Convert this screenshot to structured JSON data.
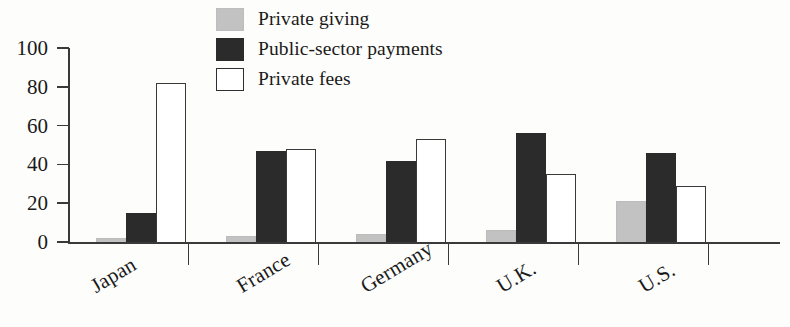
{
  "chart_data": {
    "type": "bar",
    "title": "",
    "subtitle": "",
    "xlabel": "",
    "ylabel": "",
    "ylim": [
      0,
      100
    ],
    "yticks": [
      0,
      20,
      40,
      60,
      80,
      100
    ],
    "ytick_labels": [
      "0",
      "20",
      "40",
      "60",
      "80",
      "100"
    ],
    "grid": false,
    "legend_position": "top-center",
    "categories": [
      "Japan",
      "France",
      "Germany",
      "U.K.",
      "U.S."
    ],
    "series": [
      {
        "name": "Private giving",
        "color": "#c2c2c2",
        "values": [
          2,
          3,
          4,
          6,
          21
        ]
      },
      {
        "name": "Public-sector payments",
        "color": "#2b2b2b",
        "values": [
          15,
          47,
          42,
          56,
          46
        ]
      },
      {
        "name": "Private fees",
        "color": "#ffffff",
        "values": [
          82,
          48,
          53,
          35,
          29
        ]
      }
    ]
  },
  "legend": {
    "items": [
      {
        "label": "Private giving",
        "swatch": "legend-swatch-private-giving"
      },
      {
        "label": "Public-sector payments",
        "swatch": "legend-swatch-public-sector-payments"
      },
      {
        "label": "Private fees",
        "swatch": "legend-swatch-private-fees"
      }
    ]
  },
  "axes": {
    "y": {
      "labels": [
        "100",
        "80",
        "60",
        "40",
        "20",
        "0"
      ]
    },
    "x": {
      "labels": [
        "Japan",
        "France",
        "Germany",
        "U.K.",
        "U.S."
      ]
    }
  }
}
